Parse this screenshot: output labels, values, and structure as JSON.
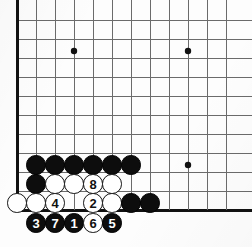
{
  "figure": {
    "kind": "go-board-diagram",
    "background_color": "#fdfdfd"
  },
  "board": {
    "origin_x": 17,
    "origin_y": 20,
    "cell": 19,
    "cols": 12,
    "rows": 11,
    "line_color": "#6b6b6b",
    "edge_color": "#111111",
    "edge_width": 3,
    "line_width": 1,
    "star_point_color": "#111111",
    "star_point_radius": 3.2,
    "star_points": [
      {
        "cx": 74,
        "cy": 51
      },
      {
        "cx": 188,
        "cy": 51
      },
      {
        "cx": 188,
        "cy": 165
      }
    ]
  },
  "stone_style": {
    "diameter": 19.5,
    "black_color": "#0d0d0d",
    "white_color": "#ffffff",
    "white_border_color": "#111111",
    "black_label_color": "#ffffff",
    "white_label_color": "#111111"
  },
  "stones": [
    {
      "id": "b-r8-c1",
      "color": "black",
      "label": "",
      "cx": 36,
      "cy": 165
    },
    {
      "id": "b-r8-c2",
      "color": "black",
      "label": "",
      "cx": 55,
      "cy": 165
    },
    {
      "id": "b-r8-c3",
      "color": "black",
      "label": "",
      "cx": 74,
      "cy": 165
    },
    {
      "id": "b-r8-c4",
      "color": "black",
      "label": "",
      "cx": 93,
      "cy": 165
    },
    {
      "id": "b-r8-c5",
      "color": "black",
      "label": "",
      "cx": 112,
      "cy": 165
    },
    {
      "id": "b-r8-c6",
      "color": "black",
      "label": "",
      "cx": 131,
      "cy": 165
    },
    {
      "id": "b-r9-c1",
      "color": "black",
      "label": "",
      "cx": 36,
      "cy": 184
    },
    {
      "id": "w-r9-c2",
      "color": "white",
      "label": "",
      "cx": 55,
      "cy": 184
    },
    {
      "id": "w-r9-c3",
      "color": "white",
      "label": "",
      "cx": 74,
      "cy": 184
    },
    {
      "id": "w-r9-c4",
      "color": "white",
      "label": "8",
      "cx": 93,
      "cy": 184
    },
    {
      "id": "w-r9-c5",
      "color": "white",
      "label": "",
      "cx": 112,
      "cy": 184
    },
    {
      "id": "w-r10-c0",
      "color": "white",
      "label": "",
      "cx": 17,
      "cy": 203
    },
    {
      "id": "w-r10-c1",
      "color": "white",
      "label": "",
      "cx": 36,
      "cy": 203
    },
    {
      "id": "w-r10-c2",
      "color": "white",
      "label": "4",
      "cx": 55,
      "cy": 203
    },
    {
      "id": "w-r10-c4",
      "color": "white",
      "label": "2",
      "cx": 93,
      "cy": 203
    },
    {
      "id": "w-r10-c5",
      "color": "white",
      "label": "",
      "cx": 112,
      "cy": 203
    },
    {
      "id": "b-r10-c6",
      "color": "black",
      "label": "",
      "cx": 131,
      "cy": 203
    },
    {
      "id": "b-r10-c7",
      "color": "black",
      "label": "",
      "cx": 150,
      "cy": 203
    },
    {
      "id": "b-r11-c1",
      "color": "black",
      "label": "3",
      "cx": 36,
      "cy": 223
    },
    {
      "id": "b-r11-c2",
      "color": "black",
      "label": "7",
      "cx": 55,
      "cy": 223
    },
    {
      "id": "b-r11-c3",
      "color": "black",
      "label": "1",
      "cx": 74,
      "cy": 223
    },
    {
      "id": "w-r11-c4",
      "color": "white",
      "label": "6",
      "cx": 93,
      "cy": 223
    },
    {
      "id": "b-r11-c5",
      "color": "black",
      "label": "5",
      "cx": 112,
      "cy": 223
    }
  ],
  "move_sequence": [
    {
      "number": "1",
      "color": "black"
    },
    {
      "number": "2",
      "color": "white"
    },
    {
      "number": "3",
      "color": "black"
    },
    {
      "number": "4",
      "color": "white"
    },
    {
      "number": "5",
      "color": "black"
    },
    {
      "number": "6",
      "color": "white"
    },
    {
      "number": "7",
      "color": "black"
    },
    {
      "number": "8",
      "color": "white"
    }
  ]
}
